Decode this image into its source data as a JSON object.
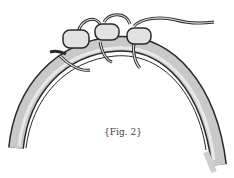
{
  "figure": {
    "caption": "{Fig. 2}",
    "bead_count": 3,
    "colors": {
      "outline": "#2a2a2a",
      "band_fill": "#c8c8c8",
      "band_highlight": "#e6e6e6",
      "bead_fill": "#e2e2e2",
      "background": "#ffffff"
    }
  }
}
